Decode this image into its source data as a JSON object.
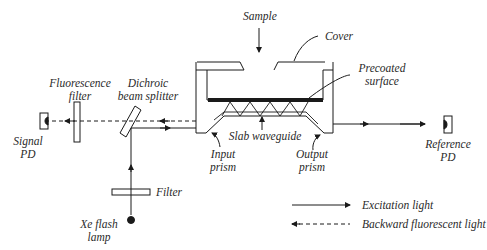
{
  "diagram": {
    "type": "optical-setup",
    "labels": {
      "sample": "Sample",
      "cover": "Cover",
      "precoated_line1": "Precoated",
      "precoated_line2": "surface",
      "fluorescence_filter_line1": "Fluorescence",
      "fluorescence_filter_line2": "filter",
      "dichroic_line1": "Dichroic",
      "dichroic_line2": "beam splitter",
      "signal_pd_line1": "Signal",
      "signal_pd_line2": "PD",
      "slab_waveguide": "Slab waveguide",
      "input_prism_line1": "Input",
      "input_prism_line2": "prism",
      "output_prism_line1": "Output",
      "output_prism_line2": "prism",
      "reference_pd_line1": "Reference",
      "reference_pd_line2": "PD",
      "filter": "Filter",
      "xe_lamp_line1": "Xe flash",
      "xe_lamp_line2": "lamp"
    },
    "legend": [
      {
        "style": "solid",
        "direction": "right",
        "label": "Excitation light"
      },
      {
        "style": "dashed",
        "direction": "left",
        "label": "Backward fluorescent light"
      }
    ],
    "colors": {
      "line": "#1a1a1a",
      "background": "#ffffff"
    }
  }
}
